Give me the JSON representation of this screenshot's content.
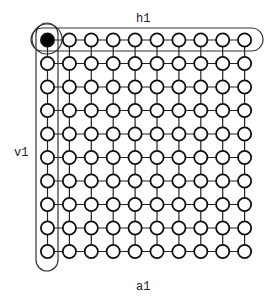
{
  "diagram": {
    "type": "grid-graph",
    "rows": 10,
    "cols": 10,
    "labels": {
      "horizontal_group": "h1",
      "vertical_group": "v1",
      "all_nodes": "a1"
    },
    "highlighted_node": {
      "row": 0,
      "col": 0,
      "style": "filled"
    },
    "groups": [
      {
        "name": "h1",
        "covers": "row 0"
      },
      {
        "name": "v1",
        "covers": "column 0"
      },
      {
        "name": "a1",
        "covers": "entire grid"
      }
    ],
    "colors": {
      "stroke": "#111111",
      "node_fill": "#ffffff",
      "highlight_fill": "#000000",
      "background": "#ffffff"
    }
  }
}
